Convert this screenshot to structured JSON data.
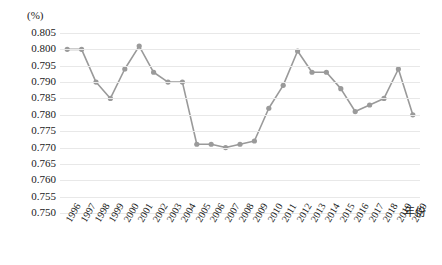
{
  "chart_data": {
    "type": "line",
    "title": "",
    "subtitle": "",
    "xlabel": "年份",
    "ylabel": "(%)",
    "unit_label": "(%)",
    "grid": true,
    "legend": null,
    "ylim": [
      0.75,
      0.805
    ],
    "ytick_step": 0.005,
    "yticks": [
      "0.805",
      "0.800",
      "0.795",
      "0.790",
      "0.785",
      "0.780",
      "0.775",
      "0.770",
      "0.765",
      "0.760",
      "0.755",
      "0.750"
    ],
    "ytick_values": [
      0.805,
      0.8,
      0.795,
      0.79,
      0.785,
      0.78,
      0.775,
      0.77,
      0.765,
      0.76,
      0.755,
      0.75
    ],
    "categories": [
      "1996",
      "1997",
      "1998",
      "1999",
      "2000",
      "2001",
      "2002",
      "2003",
      "2004",
      "2005",
      "2006",
      "2007",
      "2008",
      "2009",
      "2010",
      "2011",
      "2012",
      "2013",
      "2014",
      "2015",
      "2016",
      "2017",
      "2018",
      "2019",
      "2020"
    ],
    "values": [
      0.8,
      0.8,
      0.79,
      0.785,
      0.794,
      0.801,
      0.793,
      0.79,
      0.79,
      0.771,
      0.771,
      0.77,
      0.771,
      0.772,
      0.782,
      0.789,
      0.7995,
      0.793,
      0.793,
      0.788,
      0.781,
      0.783,
      0.785,
      0.794,
      0.78
    ],
    "series_color": "#9a9a9a",
    "marker_color": "#9a9a9a",
    "grid_color": "#e8e8e8",
    "marker_shape": "circle"
  }
}
